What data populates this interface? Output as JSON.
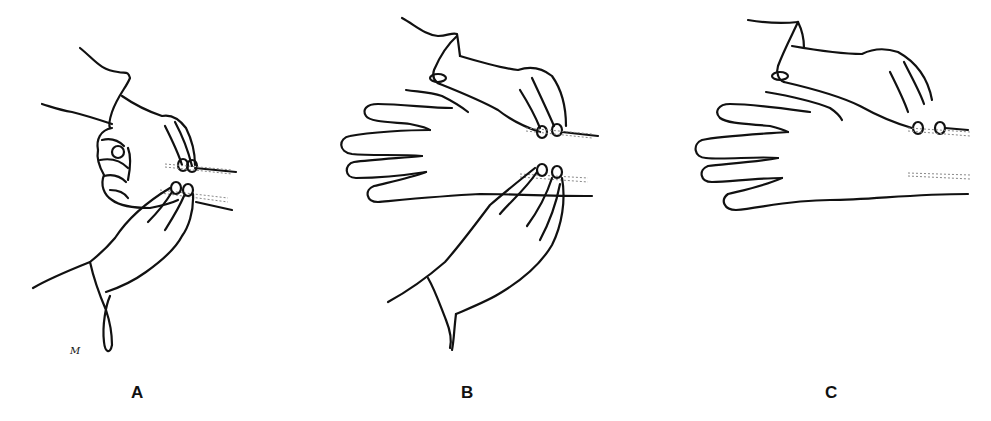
{
  "figure": {
    "panels": [
      {
        "id": "A",
        "label": "A",
        "description": "Examiner's hands palpating the radial and ulnar pulses of a clenched fist"
      },
      {
        "id": "B",
        "label": "B",
        "description": "Examiner's hands palpating the radial and ulnar pulses of an open hand"
      },
      {
        "id": "C",
        "label": "C",
        "description": "Examiner's single hand palpating the radial pulse of an open hand"
      }
    ],
    "signature": "M"
  },
  "colors": {
    "background": "#ffffff",
    "ink": "#111111",
    "vessel": "#888888"
  }
}
